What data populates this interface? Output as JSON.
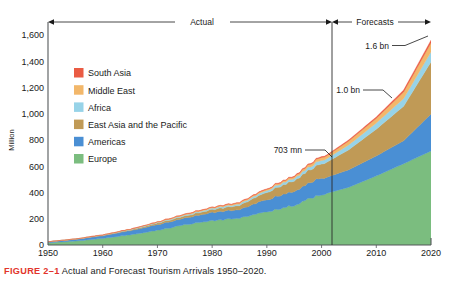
{
  "figure": {
    "number_label": "FIGURE 2–1",
    "caption": "Actual and Forecast Tourism Arrivals 1950–2020."
  },
  "chart_data": {
    "type": "area",
    "title": "",
    "xlabel": "",
    "ylabel": "Million",
    "xlim": [
      1950,
      2020
    ],
    "ylim": [
      0,
      1700
    ],
    "ytick_max_label": 1600,
    "grid": false,
    "legend_position": "inside-upper-left",
    "stacked": true,
    "annotations": [
      {
        "text": "Actual",
        "kind": "range-band",
        "from": 1950,
        "to": 2001
      },
      {
        "text": "Forecasts",
        "kind": "range-band",
        "from": 2001,
        "to": 2020
      },
      {
        "text": "703 mn",
        "kind": "callout",
        "x": 2001,
        "y": 703
      },
      {
        "text": "1.0 bn",
        "kind": "callout",
        "x": 2010,
        "y": 1006
      },
      {
        "text": "1.6 bn",
        "kind": "callout",
        "x": 2020,
        "y": 1561
      }
    ],
    "divider_year": 2001,
    "x": [
      1950,
      1955,
      1960,
      1965,
      1970,
      1975,
      1980,
      1985,
      1990,
      1995,
      2000,
      2001,
      2005,
      2010,
      2015,
      2020
    ],
    "xticks": [
      1950,
      1960,
      1970,
      1980,
      1990,
      2000,
      2010,
      2020
    ],
    "xtick_labels": [
      "1950",
      "1960",
      "1970",
      "1980",
      "1990",
      "2000",
      "2010",
      "2020"
    ],
    "yticks": [
      0,
      200,
      400,
      600,
      800,
      1000,
      1200,
      1400,
      1600
    ],
    "ytick_labels": [
      "0",
      "200",
      "400",
      "600",
      "800",
      "1,000",
      "1,200",
      "1,400",
      "1,600"
    ],
    "series": [
      {
        "name": "Europe",
        "color": "#7bbd7f",
        "values": [
          17,
          30,
          50,
          78,
          113,
          154,
          186,
          205,
          254,
          304,
          390,
          395,
          441,
          527,
          620,
          717
        ]
      },
      {
        "name": "Americas",
        "color": "#4a8fd4",
        "values": [
          7,
          13,
          20,
          31,
          43,
          50,
          62,
          65,
          93,
          109,
          128,
          122,
          133,
          152,
          175,
          282
        ]
      },
      {
        "name": "East Asia and the Pacific",
        "color": "#c09a56",
        "values": [
          0,
          1,
          3,
          6,
          11,
          16,
          22,
          32,
          56,
          82,
          111,
          115,
          153,
          204,
          263,
          397
        ]
      },
      {
        "name": "Africa",
        "color": "#97d3e8",
        "values": [
          1,
          1,
          2,
          3,
          5,
          7,
          9,
          11,
          15,
          19,
          27,
          28,
          37,
          47,
          59,
          77
        ]
      },
      {
        "name": "Middle East",
        "color": "#f2b76a",
        "values": [
          0,
          1,
          1,
          2,
          4,
          6,
          7,
          9,
          10,
          14,
          23,
          22,
          30,
          36,
          50,
          69
        ]
      },
      {
        "name": "South Asia",
        "color": "#ea5b43",
        "values": [
          0,
          0,
          1,
          1,
          1,
          2,
          2,
          3,
          3,
          4,
          6,
          6,
          8,
          10,
          14,
          19
        ]
      }
    ],
    "totals": [
      25,
      46,
      77,
      121,
      177,
      235,
      288,
      325,
      431,
      532,
      685,
      688,
      802,
      976,
      1181,
      1561
    ]
  },
  "legend": {
    "items": [
      {
        "label": "South Asia",
        "color": "#ea5b43"
      },
      {
        "label": "Middle East",
        "color": "#f2b76a"
      },
      {
        "label": "Africa",
        "color": "#97d3e8"
      },
      {
        "label": "East Asia and the Pacific",
        "color": "#c09a56"
      },
      {
        "label": "Americas",
        "color": "#4a8fd4"
      },
      {
        "label": "Europe",
        "color": "#7bbd7f"
      }
    ]
  },
  "axes": {
    "y_title": "Million",
    "y_labels": [
      "1,600",
      "1,400",
      "1,200",
      "1,000",
      "800",
      "600",
      "400",
      "200",
      "0"
    ],
    "x_labels": [
      "1950",
      "1960",
      "1970",
      "1980",
      "1990",
      "2000",
      "2010",
      "2020"
    ]
  },
  "bands": {
    "actual": "Actual",
    "forecasts": "Forecasts"
  },
  "callouts": {
    "mn703": "703 mn",
    "bn10": "1.0 bn",
    "bn16": "1.6 bn"
  }
}
